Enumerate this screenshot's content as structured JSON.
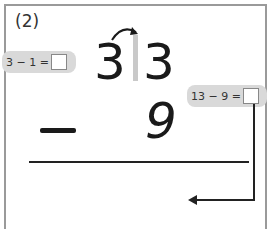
{
  "problem": {
    "label": "(2)",
    "top_tens": "3",
    "top_ones": "3",
    "operator": "−",
    "bottom_ones": "9",
    "hint_left": "3 − 1 =",
    "hint_right": "13 − 9 ="
  }
}
